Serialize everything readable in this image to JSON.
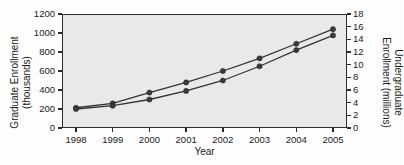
{
  "chart_data": {
    "type": "line",
    "title": "",
    "xlabel": "Year",
    "categories": [
      "1998",
      "1999",
      "2000",
      "2001",
      "2002",
      "2003",
      "2004",
      "2005"
    ],
    "x": [
      1998,
      1999,
      2000,
      2001,
      2002,
      2003,
      2004,
      2005
    ],
    "grid": false,
    "legend": "none",
    "axes": {
      "left": {
        "label": "Graduate Enrollment (thousands)",
        "label_line1": "Graduate Enrollment",
        "label_line2": "(thousands)",
        "ticks": [
          0,
          200,
          400,
          600,
          800,
          1000,
          1200
        ],
        "tick_labels": [
          "0",
          "200",
          "400",
          "600",
          "800",
          "1000",
          "1200"
        ],
        "lim": [
          0,
          1200
        ]
      },
      "right": {
        "label": "Undergraduate Enrollment (millions)",
        "label_line1": "Undergraduate",
        "label_line2": "Enrollment (millions)",
        "ticks": [
          0,
          2,
          4,
          6,
          8,
          10,
          12,
          14,
          16,
          18
        ],
        "tick_labels": [
          "0",
          "2",
          "4",
          "6",
          "8",
          "10",
          "12",
          "14",
          "16",
          "18"
        ],
        "lim": [
          0,
          18
        ]
      },
      "bottom": {
        "label": "Year",
        "lim": [
          1998,
          2005
        ]
      }
    },
    "series": [
      {
        "name": "Undergraduate Enrollment (millions)",
        "axis": "right",
        "marker": "circle",
        "color": "#3a3a3a",
        "values": [
          3.2,
          3.9,
          5.6,
          7.2,
          9.0,
          11.0,
          13.3,
          15.6
        ]
      },
      {
        "name": "Graduate Enrollment (thousands)",
        "axis": "left",
        "marker": "circle",
        "color": "#3a3a3a",
        "values": [
          200,
          235,
          300,
          390,
          500,
          650,
          820,
          975
        ]
      }
    ]
  },
  "figure": {
    "background_color": "#fdfdfd",
    "plot_background_color": "#e9e9e9",
    "frame_color": "#2b2b2b"
  }
}
